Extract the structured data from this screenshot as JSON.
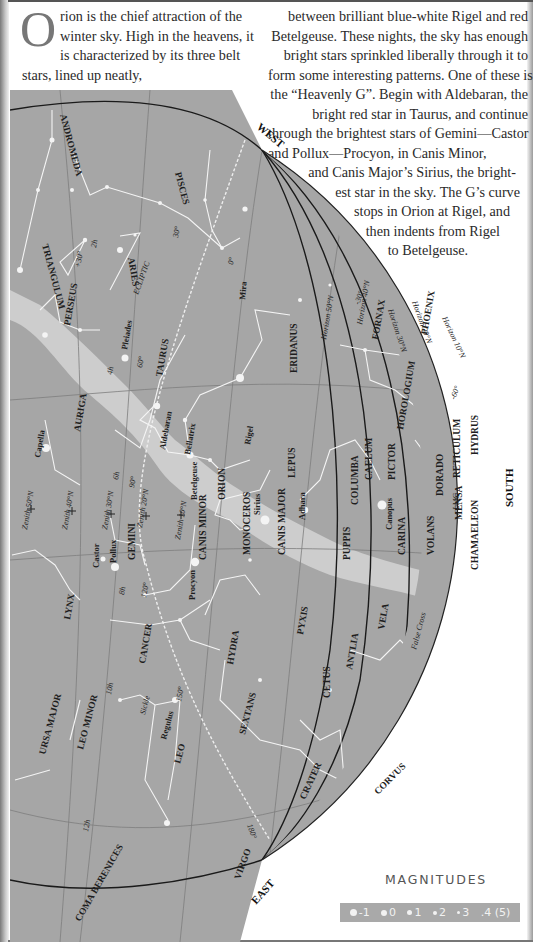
{
  "intro": {
    "dropcap": "O",
    "left_text": "rion is the chief attraction of the winter sky. High in the heavens, it is characterized by its three belt stars, lined up neatly,",
    "right_lines": [
      "between brilliant blue-white Rigel and red",
      "Betelgeuse. These nights, the sky has enough",
      "bright stars sprinkled liberally through it to",
      "form some interesting patterns. One of these is",
      "the “Heavenly G”. Begin with Aldebaran, the",
      "bright red star in Taurus, and continue",
      "through the brightest stars of Gemini—Castor",
      "and Pollux—Procyon, in Canis Minor,",
      "and Canis Major’s Sirius, the bright-",
      "est star in the sky. The G’s curve",
      "stops in Orion at Rigel, and",
      "then indents from Rigel",
      "to Betelgeuse."
    ]
  },
  "chart": {
    "colors": {
      "sky": "#a6a6a6",
      "milky_way": "#cfcfcf",
      "lines": "#f4f4f4",
      "horizon": "#1a1a1a",
      "grid": "#7d7d7d"
    },
    "directions": {
      "west": "WEST",
      "east": "EAST",
      "south": "SOUTH"
    },
    "ecliptic_label": "ECLIPTIC",
    "constellations": [
      "ANDROMEDA",
      "PISCES",
      "CETUS",
      "TRIANGULUM",
      "ARIES",
      "PERSEUS",
      "TAURUS",
      "ERIDANUS",
      "FORNAX",
      "PHOENIX",
      "HOROLOGIUM",
      "AURIGA",
      "ORION",
      "LEPUS",
      "COLUMBA",
      "CAELUM",
      "PICTOR",
      "DORADO",
      "RETICULUM",
      "HYDRUS",
      "GEMINI",
      "CANIS MINOR",
      "MONOCEROS",
      "CANIS MAJOR",
      "PUPPIS",
      "CARINA",
      "VOLANS",
      "MENSA",
      "CHAMAELEON",
      "LYNX",
      "CANCER",
      "HYDRA",
      "PYXIS",
      "ANTLIA",
      "VELA",
      "URSA MAJOR",
      "LEO MINOR",
      "LEO",
      "SEXTANS",
      "CRATER",
      "CORVUS",
      "COMA BERENICES",
      "VIRGO"
    ],
    "stars": [
      "Mira",
      "Pleiades",
      "Aldebaran",
      "Bellatrix",
      "Betelgeuse",
      "Rigel",
      "Capella",
      "Castor",
      "Pollux",
      "Procyon",
      "Sirius",
      "Adhara",
      "Canopus",
      "Regulus"
    ],
    "asterisms": [
      "Sickle",
      "False Cross",
      "LMC"
    ],
    "horizons": [
      "Horizon 10°N",
      "Horizon 20°N",
      "Horizon 30°N",
      "Horizon 40°N",
      "Horizon 50°N"
    ],
    "zeniths": [
      "Zenith 50°N",
      "Zenith 40°N",
      "Zenith 30°N",
      "Zenith 20°N",
      "Zenith 10°N"
    ],
    "ra_labels": [
      "2h",
      "4h",
      "6h",
      "8h",
      "10h",
      "12h"
    ],
    "ecliptic_degrees": [
      "0°",
      "30°",
      "60°",
      "90°",
      "120°",
      "150°",
      "180°"
    ],
    "dec_labels": [
      "+30°",
      "-30°",
      "-60°"
    ]
  },
  "magnitudes": {
    "title": "MAGNITUDES",
    "items": [
      {
        "label": "-1",
        "size": 7
      },
      {
        "label": "0",
        "size": 6
      },
      {
        "label": "1",
        "size": 5
      },
      {
        "label": "2",
        "size": 4
      },
      {
        "label": "3",
        "size": 3
      },
      {
        "label": ".4 (5)",
        "size": 0
      }
    ]
  }
}
